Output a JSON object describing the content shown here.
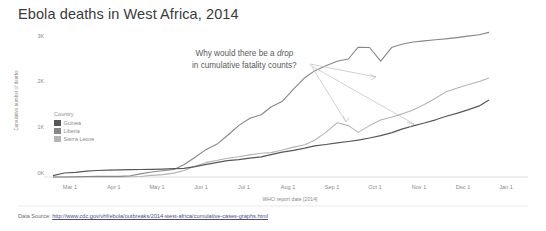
{
  "chart_data": {
    "type": "line",
    "title": "Ebola deaths in West Africa, 2014",
    "xlabel": "WHO report date [2014]",
    "ylabel": "Cumulative number of deaths",
    "ylim": [
      0,
      3200
    ],
    "yticks": [
      "0K",
      "1K",
      "2K",
      "3K"
    ],
    "ytick_values": [
      0,
      1000,
      2000,
      3000
    ],
    "xticks": [
      "Mar 1",
      "Apr 1",
      "May 1",
      "Jun 1",
      "Jul 1",
      "Aug 1",
      "Sep 1",
      "Oct 1",
      "Nov 1",
      "Dec 1",
      "Jan 1"
    ],
    "grid": false,
    "legend_position": "inside-left",
    "legend_title": "Country",
    "x": [
      0,
      8,
      16,
      24,
      31,
      39,
      47,
      55,
      62,
      70,
      78,
      86,
      93,
      101,
      109,
      117,
      124,
      132,
      140,
      148,
      155,
      163,
      171,
      179,
      186,
      194,
      202,
      210,
      217,
      225,
      233,
      241,
      248,
      256,
      264,
      272,
      279,
      287,
      295,
      303,
      310
    ],
    "series": [
      {
        "name": "Guinea",
        "color": "#575757",
        "values": [
          29,
          83,
          95,
          122,
          136,
          143,
          149,
          155,
          157,
          160,
          164,
          173,
          182,
          215,
          264,
          304,
          339,
          363,
          394,
          421,
          467,
          518,
          557,
          601,
          648,
          678,
          710,
          739,
          768,
          812,
          861,
          926,
          997,
          1067,
          1126,
          1192,
          1260,
          1327,
          1398,
          1481,
          1607
        ]
      },
      {
        "name": "Liberia",
        "color": "#878787",
        "values": [
          0,
          0,
          6,
          11,
          12,
          12,
          13,
          24,
          65,
          105,
          129,
          156,
          255,
          413,
          576,
          694,
          865,
          1070,
          1224,
          1296,
          1459,
          1578,
          1830,
          2069,
          2210,
          2316,
          2413,
          2458,
          2705,
          2697,
          2413,
          2705,
          2766,
          2812,
          2836,
          2858,
          2877,
          2904,
          2936,
          2963,
          3013
        ]
      },
      {
        "name": "Sierra Leone",
        "color": "#b4b4b4",
        "values": [
          0,
          0,
          0,
          0,
          0,
          0,
          3,
          6,
          11,
          34,
          49,
          81,
          135,
          224,
          305,
          348,
          392,
          422,
          461,
          493,
          509,
          562,
          622,
          670,
          765,
          930,
          1130,
          1070,
          930,
          1070,
          1187,
          1250,
          1310,
          1398,
          1510,
          1640,
          1768,
          1850,
          1920,
          1990,
          2062
        ]
      }
    ],
    "annotations": [
      {
        "id": "drop-question",
        "line1": "Why would there be a ",
        "emphasis": "drop",
        "line2": "in cumulative fatality counts?"
      }
    ]
  },
  "source": {
    "label": "Data Source: ",
    "url": "http://www.cdc.gov/vhf/ebola/outbreaks/2014-west-africa/cumulative-cases-graphs.html"
  }
}
